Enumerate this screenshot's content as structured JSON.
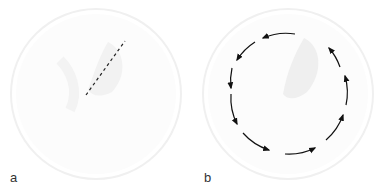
{
  "figure": {
    "panels": [
      {
        "label": "a",
        "description": "disk with dashed line"
      },
      {
        "label": "b",
        "description": "disk with circular arrows (counterclockwise)"
      }
    ]
  }
}
